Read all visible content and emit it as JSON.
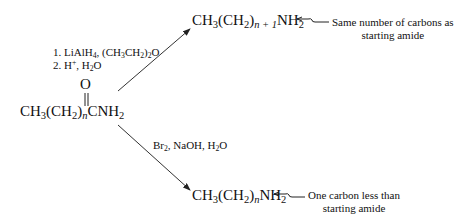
{
  "reactant": {
    "formula": "CH3(CH2)nCNH2",
    "carbonyl_oxygen": "O",
    "parts": {
      "a": "CH",
      "a_sub": "3",
      "b": "(CH",
      "b_sub": "2",
      "c": ")",
      "n": "n",
      "d": "CNH",
      "d_sub": "2"
    }
  },
  "upper_path": {
    "conditions": [
      "1. LiAlH4, (CH3CH2)2O",
      "2. H+, H2O"
    ],
    "product": "CH3(CH2)n+1NH2",
    "product_sub_n": "n + 1",
    "note_line1": "Same number of carbons as",
    "note_line2": "starting amide"
  },
  "lower_path": {
    "conditions": "Br2, NaOH, H2O",
    "product": "CH3(CH2)nNH2",
    "product_sub_n": "n",
    "note_line1": "One carbon less than",
    "note_line2": "starting amide"
  },
  "colors": {
    "ink": "#111111",
    "background": "#ffffff"
  }
}
